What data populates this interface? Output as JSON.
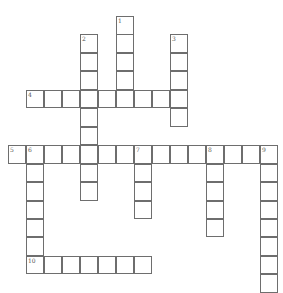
{
  "puzzle": {
    "type": "crossword",
    "cell_size": 18,
    "row_pitch": 18.45,
    "origin_x": 8,
    "origin_y": 16,
    "colors": {
      "border": "#6e6e6e",
      "cell_bg": "#ffffff",
      "number": "#555555"
    },
    "words": [
      {
        "number": 1,
        "direction": "down",
        "row": 0,
        "col": 6,
        "length": 5
      },
      {
        "number": 2,
        "direction": "down",
        "row": 1,
        "col": 4,
        "length": 9
      },
      {
        "number": 3,
        "direction": "down",
        "row": 1,
        "col": 9,
        "length": 5
      },
      {
        "number": 4,
        "direction": "across",
        "row": 4,
        "col": 1,
        "length": 9
      },
      {
        "number": 5,
        "direction": "across",
        "row": 7,
        "col": 0,
        "length": 15
      },
      {
        "number": 6,
        "direction": "down",
        "row": 7,
        "col": 1,
        "length": 7
      },
      {
        "number": 7,
        "direction": "down",
        "row": 7,
        "col": 7,
        "length": 4
      },
      {
        "number": 8,
        "direction": "down",
        "row": 7,
        "col": 11,
        "length": 5
      },
      {
        "number": 9,
        "direction": "down",
        "row": 7,
        "col": 14,
        "length": 8
      },
      {
        "number": 10,
        "direction": "across",
        "row": 13,
        "col": 1,
        "length": 7
      }
    ]
  }
}
